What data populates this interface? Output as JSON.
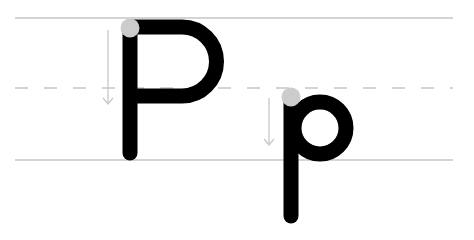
{
  "title": "Letter P handwriting guide",
  "letters": [
    {
      "char": "P",
      "case": "uppercase"
    },
    {
      "char": "p",
      "case": "lowercase"
    }
  ],
  "colors": {
    "background": "#ffffff",
    "guide_line": "#c8c8c8",
    "dashed_line": "#c8c8c8",
    "letter": "#000000",
    "start_dot": "#cccccc",
    "arrow": "#c8c8c8"
  },
  "guides": {
    "top_line_y": 18,
    "mid_dashed_y": 88,
    "baseline_y": 160
  }
}
